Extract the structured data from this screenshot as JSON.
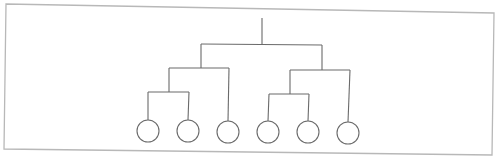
{
  "diagram": {
    "type": "binary-tree",
    "colors": {
      "background": "#ffffff",
      "frame": "#b8b8b8",
      "lines": "#6a6a6a"
    },
    "frame": {
      "points": [
        [
          6,
          4
        ],
        [
          494,
          13
        ],
        [
          492,
          155
        ],
        [
          4,
          149
        ]
      ]
    },
    "root": {
      "stem": {
        "x": 262,
        "y_top": 18,
        "y_bottom": 44
      },
      "bar": {
        "x1": 201,
        "y1": 44,
        "x2": 322,
        "y2": 45
      }
    },
    "subtrees": [
      {
        "name": "left",
        "stem": {
          "x": 201,
          "y_top": 44,
          "y_bottom": 68
        },
        "bar": {
          "x1": 169,
          "y1": 68,
          "x2": 229,
          "y2": 68
        },
        "inner": {
          "stem": {
            "x": 169,
            "y_top": 68,
            "y_bottom": 92
          },
          "bar": {
            "x1": 148,
            "y1": 92,
            "x2": 189,
            "y2": 92
          },
          "leaves": [
            0,
            1
          ]
        },
        "direct_leaf": 2
      },
      {
        "name": "right",
        "stem": {
          "x": 322,
          "y_top": 45,
          "y_bottom": 70
        },
        "bar": {
          "x1": 290,
          "y1": 70,
          "x2": 350,
          "y2": 70
        },
        "inner": {
          "stem": {
            "x": 290,
            "y_top": 70,
            "y_bottom": 94
          },
          "bar": {
            "x1": 269,
            "y1": 94,
            "x2": 309,
            "y2": 94
          },
          "leaves": [
            3,
            4
          ]
        },
        "direct_leaf": 5
      }
    ],
    "leaves": [
      {
        "id": "leaf-1",
        "cx": 148,
        "cy": 131,
        "r": 11
      },
      {
        "id": "leaf-2",
        "cx": 188,
        "cy": 131,
        "r": 11
      },
      {
        "id": "leaf-3",
        "cx": 228,
        "cy": 132,
        "r": 11
      },
      {
        "id": "leaf-4",
        "cx": 268,
        "cy": 132,
        "r": 11
      },
      {
        "id": "leaf-5",
        "cx": 308,
        "cy": 132,
        "r": 11
      },
      {
        "id": "leaf-6",
        "cx": 348,
        "cy": 133,
        "r": 11
      }
    ]
  }
}
